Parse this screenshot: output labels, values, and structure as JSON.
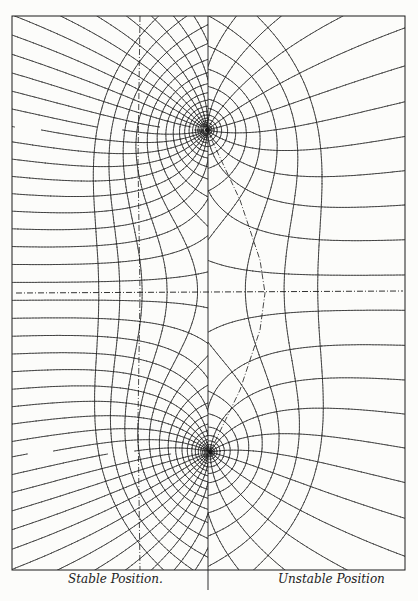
{
  "figure": {
    "type": "field line diagram",
    "panels": [
      {
        "side": "left",
        "caption": "Stable Position."
      },
      {
        "side": "right",
        "caption": "Unstable Position"
      }
    ],
    "singular_points": [
      {
        "label": "upper",
        "x": 207,
        "y": 130
      },
      {
        "label": "lower",
        "x": 210,
        "y": 452
      }
    ],
    "frame": {
      "left": 12,
      "top": 16,
      "right": 405,
      "bottom": 570
    },
    "divider_x": 208,
    "midline_y": 293,
    "colors": {
      "ink": "#1a1a1a",
      "paper": "#fcfcfa"
    }
  }
}
